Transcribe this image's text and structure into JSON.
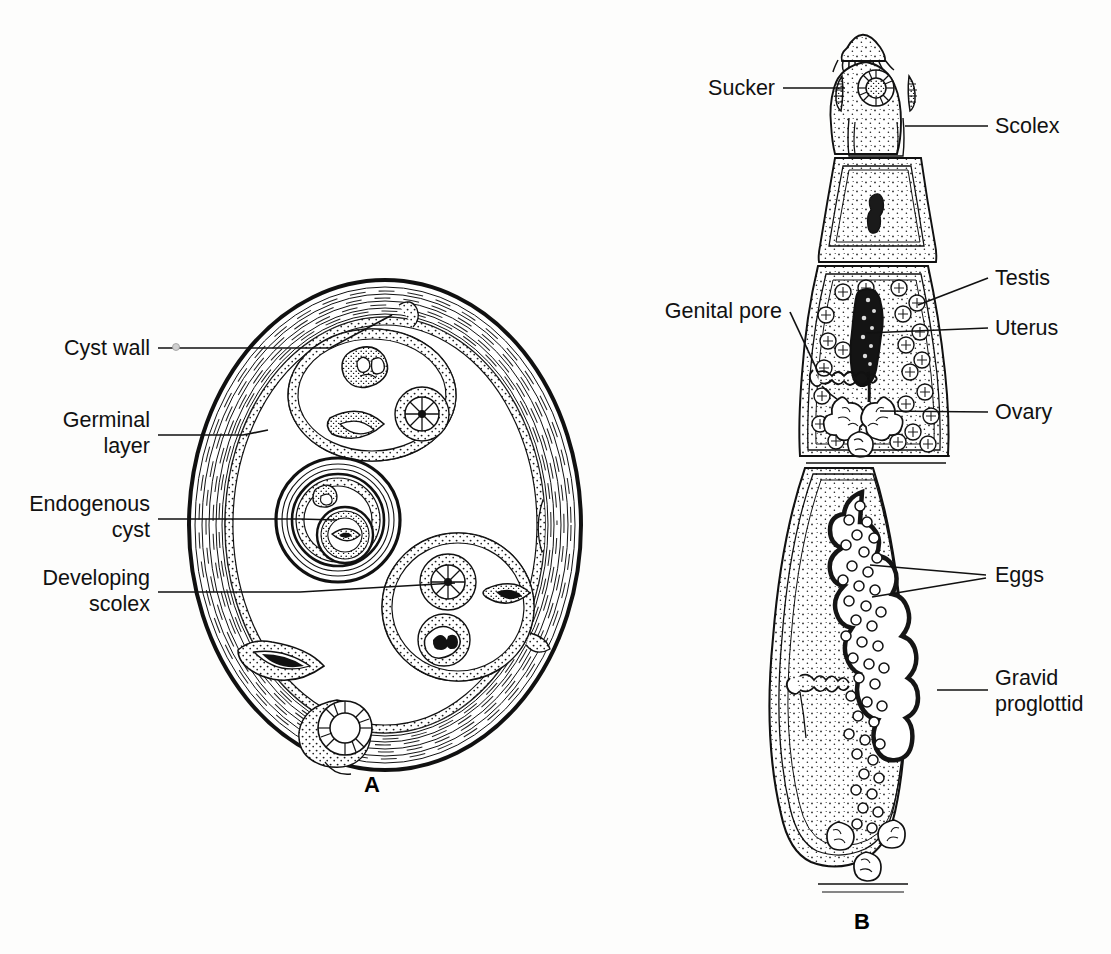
{
  "figure": {
    "background_color": "#fdfdfc",
    "ink_color": "#111111",
    "style": "black-and-white line drawing"
  },
  "panels": [
    {
      "letter": "A",
      "name": "hydatid-cyst-cross-section",
      "letter_x": 372,
      "letter_y": 792,
      "labels": [
        {
          "id": "cyst-wall",
          "text": "Cyst wall",
          "lines": [
            "Cyst wall"
          ],
          "text_x": 150,
          "text_y": 355,
          "side": "left",
          "leader": [
            [
              158,
              348
            ],
            [
              330,
              348
            ],
            [
              392,
              315
            ]
          ]
        },
        {
          "id": "germinal-layer",
          "text": "Germinal layer",
          "lines": [
            "Germinal",
            "layer"
          ],
          "text_x": 150,
          "text_y": 418,
          "side": "left",
          "leader": [
            [
              158,
              435
            ],
            [
              243,
              435
            ],
            [
              268,
              430
            ]
          ]
        },
        {
          "id": "endogenous-cyst",
          "text": "Endogenous cyst",
          "lines": [
            "Endogenous",
            "cyst"
          ],
          "text_x": 150,
          "text_y": 508,
          "side": "left",
          "leader": [
            [
              158,
              519
            ],
            [
              300,
              519
            ],
            [
              337,
              520
            ]
          ]
        },
        {
          "id": "developing-scolex",
          "text": "Developing scolex",
          "lines": [
            "Developing",
            "scolex"
          ],
          "text_x": 150,
          "text_y": 588,
          "side": "left",
          "leader": [
            [
              158,
              592
            ],
            [
              300,
              592
            ],
            [
              455,
              583
            ]
          ]
        }
      ]
    },
    {
      "letter": "B",
      "name": "adult-tapeworm",
      "letter_x": 862,
      "letter_y": 929,
      "labels": [
        {
          "id": "sucker",
          "text": "Sucker",
          "lines": [
            "Sucker"
          ],
          "text_x": 775,
          "text_y": 95,
          "side": "left",
          "leader": [
            [
              783,
              88
            ],
            [
              845,
              88
            ]
          ]
        },
        {
          "id": "scolex",
          "text": "Scolex",
          "lines": [
            "Scolex"
          ],
          "text_x": 995,
          "text_y": 133,
          "side": "right",
          "leader": [
            [
              988,
              126
            ],
            [
              905,
              126
            ]
          ]
        },
        {
          "id": "testis",
          "text": "Testis",
          "lines": [
            "Testis"
          ],
          "text_x": 995,
          "text_y": 285,
          "side": "right",
          "leader": [
            [
              988,
              278
            ],
            [
              918,
              305
            ]
          ]
        },
        {
          "id": "genital-pore",
          "text": "Genital pore",
          "lines": [
            "Genital pore"
          ],
          "text_x": 782,
          "text_y": 318,
          "side": "left",
          "leader": [
            [
              790,
              312
            ],
            [
              818,
              372
            ]
          ]
        },
        {
          "id": "uterus",
          "text": "Uterus",
          "lines": [
            "Uterus"
          ],
          "text_x": 995,
          "text_y": 335,
          "side": "right",
          "leader": [
            [
              988,
              328
            ],
            [
              866,
              333
            ]
          ]
        },
        {
          "id": "ovary",
          "text": "Ovary",
          "lines": [
            "Ovary"
          ],
          "text_x": 995,
          "text_y": 419,
          "side": "right",
          "leader": [
            [
              988,
              412
            ],
            [
              880,
              411
            ]
          ]
        },
        {
          "id": "eggs",
          "text": "Eggs",
          "lines": [
            "Eggs"
          ],
          "text_x": 995,
          "text_y": 582,
          "side": "right",
          "leader_fork": [
            [
              [
                986,
                575
              ],
              [
                870,
                565
              ]
            ],
            [
              [
                986,
                577
              ],
              [
                872,
                597
              ]
            ]
          ]
        },
        {
          "id": "gravid-proglottid",
          "text": "Gravid proglottid",
          "lines": [
            "Gravid",
            "proglottid"
          ],
          "text_x": 995,
          "text_y": 692,
          "side": "right",
          "leader": [
            [
              988,
              690
            ],
            [
              937,
              690
            ]
          ]
        }
      ]
    }
  ],
  "structures": {
    "cyst": {
      "center_x": 385,
      "center_y": 525,
      "radius_x": 196,
      "radius_y": 245,
      "wall_name": "laminated-cyst-wall",
      "germinal_layer_name": "germinal-layer-band",
      "brood_capsules": 4,
      "endogenous_cysts": 1
    },
    "worm": {
      "segments": [
        "scolex",
        "neck",
        "immature-proglottid",
        "mature-proglottid",
        "gravid-proglottid"
      ],
      "scolex_features": [
        "rostellum-with-hooks",
        "central-sucker",
        "lateral-suckers"
      ]
    }
  }
}
